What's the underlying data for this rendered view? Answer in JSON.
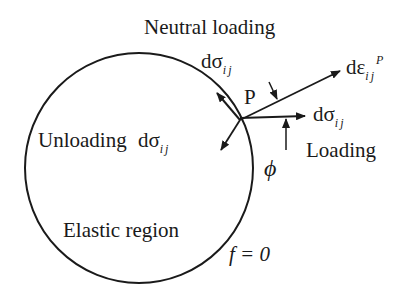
{
  "diagram": {
    "labels": {
      "neutral_loading": "Neutral loading",
      "unloading": "Unloading",
      "loading": "Loading",
      "elastic_region": "Elastic region",
      "point": "P",
      "angle": "ϕ",
      "yield_surface": "f = 0",
      "d_sigma": "dσ",
      "d_sigma_sub": "ij",
      "d_eps": "dε",
      "d_eps_sub": "ij",
      "d_eps_sup": "P"
    },
    "colors": {
      "stroke": "#1a1a1a",
      "background": "#ffffff"
    }
  }
}
